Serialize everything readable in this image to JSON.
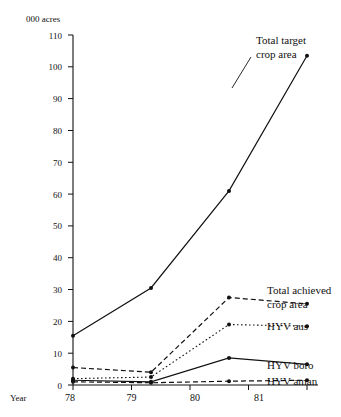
{
  "chart_data": {
    "type": "line",
    "title": "",
    "ylabel": "000 acres",
    "xlabel": "Year",
    "categories": [
      "78",
      "79",
      "80",
      "81"
    ],
    "x": [
      1978,
      1979,
      1980,
      1981
    ],
    "ylim": [
      0,
      110
    ],
    "yticks": [
      0,
      10,
      20,
      30,
      40,
      50,
      60,
      70,
      80,
      90,
      100,
      110
    ],
    "ytick_labels": [
      "0",
      "10",
      "20",
      "30",
      "40",
      "50",
      "60",
      "70",
      "80",
      "90",
      "100",
      "110"
    ],
    "xtick_labels": [
      "78",
      "79",
      "80",
      "81"
    ],
    "grid": false,
    "legend_position": "right-inline-annotations",
    "series": [
      {
        "name": "Total target crop area",
        "style": "solid",
        "values": [
          15.5,
          30.5,
          61,
          103.5
        ],
        "label": "Total target\ncrop area",
        "label_line1": "Total target",
        "label_line2": "crop area"
      },
      {
        "name": "Total achieved crop area",
        "style": "dashed",
        "values": [
          5.5,
          4.0,
          27.5,
          25.5
        ],
        "label_line1": "Total achieved",
        "label_line2": "crop area"
      },
      {
        "name": "HYV aus",
        "style": "dotted",
        "values": [
          2.0,
          2.5,
          19.0,
          18.5
        ],
        "label_line1": "HYV aus"
      },
      {
        "name": "HYV boro",
        "style": "solid",
        "values": [
          1.5,
          1.0,
          8.5,
          6.5
        ],
        "label_line1": "HYV boro"
      },
      {
        "name": "HYV aman",
        "style": "dashed",
        "values": [
          1.0,
          0.7,
          1.2,
          1.5
        ],
        "label_line1": "HYV aman"
      }
    ],
    "annotations": [
      {
        "text": "Total target",
        "series": "Total target crop area"
      },
      {
        "text": "crop area",
        "series": "Total target crop area"
      },
      {
        "text": "Total achieved",
        "series": "Total achieved crop area"
      },
      {
        "text": "crop area",
        "series": "Total achieved crop area"
      },
      {
        "text": "HYV aus",
        "series": "HYV aus"
      },
      {
        "text": "HYV boro",
        "series": "HYV boro"
      },
      {
        "text": "HYV aman",
        "series": "HYV aman"
      }
    ]
  },
  "axes": {
    "y_unit_label": "000 acres",
    "x_axis_name": "Year",
    "ytick_0": "0",
    "ytick_10": "10",
    "ytick_20": "20",
    "ytick_30": "30",
    "ytick_40": "40",
    "ytick_50": "50",
    "ytick_60": "60",
    "ytick_70": "70",
    "ytick_80": "80",
    "ytick_90": "90",
    "ytick_100": "100",
    "ytick_110": "110",
    "xtick_78": "78",
    "xtick_79": "79",
    "xtick_80": "80",
    "xtick_81": "81"
  },
  "labels": {
    "target_l1": "Total target",
    "target_l2": "crop area",
    "achieved_l1": "Total achieved",
    "achieved_l2": "crop area",
    "hyv_aus": "HYV aus",
    "hyv_boro": "HYV boro",
    "hyv_aman": "HYV aman"
  },
  "colors": {
    "ink": "#111111",
    "background": "#ffffff"
  }
}
